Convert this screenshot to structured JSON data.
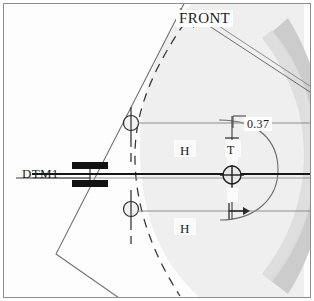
{
  "drawing": {
    "title": "FRONT",
    "view_name": "FRONT",
    "datum_label": "DTM1",
    "dimension_value": "0.37",
    "target_labels": {
      "upper_h": "H",
      "lower_h": "H",
      "upper_t": "T"
    },
    "colors": {
      "background": "#fdfdfd",
      "frame_border": "#8d8d8d",
      "outline": "#6f6f6f",
      "centerline": "#000000",
      "datum_bar": "#111111",
      "shade_light": "#eeeeee",
      "shade_mid": "#e2e2e2",
      "shade_dark": "#c6c6c6",
      "text": "#1b1b1b",
      "leader": "#7a7a7a"
    },
    "icons": {
      "datum_target_upper": "datum-target-circle-icon",
      "datum_target_center": "datum-target-crosshair-icon",
      "datum_target_lower": "datum-target-circle-icon",
      "datum_feature_symbol": "datum-feature-bar-icon",
      "dimension_arrow": "dimension-arrow-icon"
    }
  }
}
